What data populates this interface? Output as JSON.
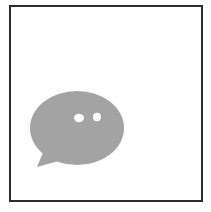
{
  "icon": {
    "name": "chat-bubble-icon",
    "bubble_color": "#a3a3a3",
    "dot_color": "#ffffff",
    "frame_color": "#2e2e2e",
    "background_color": "#ffffff"
  }
}
